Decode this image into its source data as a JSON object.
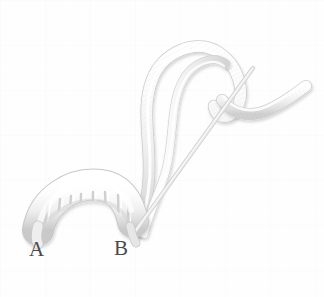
{
  "figure": {
    "background_color": "#fefefe",
    "grid_color": "#fbfbfc",
    "thread_color": "#f2f2f2",
    "thread_shade_color": "#d8d8d8",
    "thread_outline_color": "#cfcfcf",
    "label_color": "#4a4a4a",
    "labels": [
      {
        "id": "a",
        "text": "A",
        "x": 29,
        "y": 239
      },
      {
        "id": "b",
        "text": "B",
        "x": 114,
        "y": 238
      }
    ],
    "coil": {
      "name": "wrapped-coil",
      "wrap_count": 8,
      "start_x": 36,
      "start_y": 225,
      "end_x": 128,
      "end_y": 228
    },
    "loop": {
      "name": "thread-loop",
      "apex_x": 186,
      "apex_y": 50
    },
    "straight_thread": {
      "name": "straight-thread",
      "x1": 253,
      "y1": 68,
      "x2": 132,
      "y2": 234
    },
    "tail": {
      "name": "thread-tail",
      "end_x": 306,
      "end_y": 92
    }
  }
}
